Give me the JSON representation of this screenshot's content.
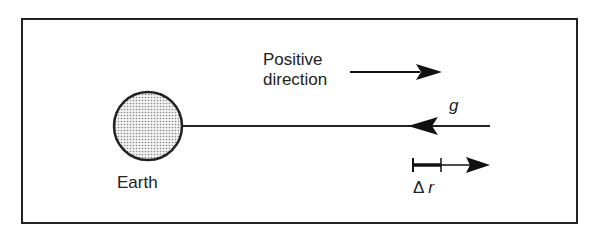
{
  "diagram": {
    "earth_label": "Earth",
    "positive_direction_label_line1": "Positive",
    "positive_direction_label_line2": "direction",
    "gravity_label": "g",
    "delta_r_symbol": "Δ",
    "delta_r_var": "r",
    "colors": {
      "stroke": "#222222",
      "earth_fill": "#d8d8d8",
      "background": "#ffffff"
    }
  }
}
